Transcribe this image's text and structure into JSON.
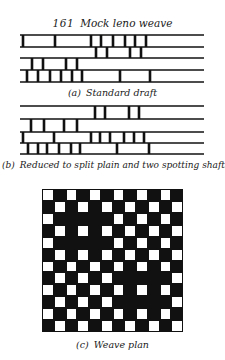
{
  "figure": {
    "number": "161",
    "title": "Mock leno weave"
  },
  "drafts": [
    {
      "label": "(a)",
      "caption": "Standard draft",
      "line_y": [
        35,
        47,
        58,
        70,
        82
      ],
      "x_start": 20,
      "x_end": 204,
      "marks": [
        [
          23,
          55,
          91,
          101,
          113,
          125,
          135,
          146
        ],
        [
          96,
          107,
          130,
          141
        ],
        [
          32,
          43,
          66,
          77
        ],
        [
          27,
          38,
          50,
          61,
          72,
          82,
          120,
          150
        ]
      ]
    },
    {
      "label": "(b)",
      "caption": "Reduced to split plain and two spotting shafts",
      "line_y": [
        106,
        119,
        132,
        143,
        154
      ],
      "x_start": 20,
      "x_end": 204,
      "marks": [
        [
          95,
          105,
          129,
          139
        ],
        [
          31,
          44,
          64,
          77
        ],
        [
          23,
          54,
          91,
          100,
          110,
          124,
          134,
          144
        ],
        [
          28,
          38,
          47,
          59,
          71,
          80,
          117,
          149
        ]
      ]
    }
  ],
  "weave_plan": {
    "label": "(c)",
    "caption": "Weave plan",
    "rows": 12,
    "cols": 12,
    "legend": {
      "W": "white (weft up)",
      "B": "black (warp up)"
    },
    "grid": [
      "WBWBWBWBWBWB",
      "BWBWBWBWBWBW",
      "WBBBBBWBWBWB",
      "BWBWBWBWBWBW",
      "WBBBBBWBWBWB",
      "BWBWBWBWBWBW",
      "WBWBWBWBWBWB",
      "BWBWBWBBBBBW",
      "WBWBWBWBWBWB",
      "BWBWBWBBBBBW",
      "WBWBWBWBWBWB",
      "BWBWBWBWBWBW"
    ]
  },
  "colors": {
    "ink": "#111111",
    "paper": "#ffffff"
  }
}
